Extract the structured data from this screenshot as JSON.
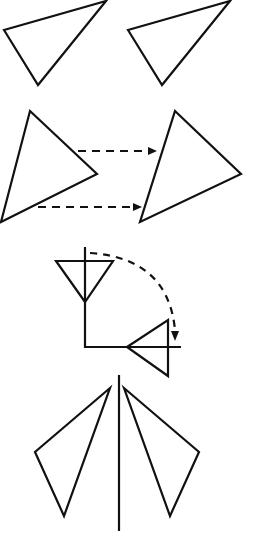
{
  "figure": {
    "width": 257,
    "height": 551,
    "stroke_color": "#111111",
    "background": "#ffffff",
    "panels": [
      {
        "name": "identical-triangles",
        "description": "Two congruent triangles side by side",
        "triangles": [
          {
            "points": "4,30 106,1 38,85"
          },
          {
            "points": "128,30 230,1 162,85"
          }
        ]
      },
      {
        "name": "translation",
        "description": "Triangle translated right with dashed arrows",
        "triangles": [
          {
            "points": "30,111 97,174 1,222"
          },
          {
            "points": "175,111 241,174 140,222"
          }
        ],
        "arrows": [
          {
            "x1": 78,
            "y1": 151,
            "x2": 156,
            "y2": 151
          },
          {
            "x1": 38,
            "y1": 207,
            "x2": 141,
            "y2": 207
          }
        ]
      },
      {
        "name": "rotation",
        "description": "Triangle rotated 90 degrees clockwise about a point",
        "triangles": [
          {
            "points": "56,261 113,261 85,302"
          },
          {
            "points": "127,347 168,320 168,376"
          }
        ],
        "axes": {
          "vertical": {
            "x": 85,
            "y1": 247,
            "y2": 347
          },
          "horizontal": {
            "y": 347,
            "x1": 85,
            "x2": 181
          }
        },
        "arc": "M 90 253 Q 168 262 175 336"
      },
      {
        "name": "reflection",
        "description": "Triangle reflected across a vertical mirror line",
        "triangles": [
          {
            "points": "110,388 35,452 64,516"
          },
          {
            "points": "124,388 199,452 170,516"
          }
        ],
        "mirror": {
          "x": 119,
          "y1": 375,
          "y2": 531
        }
      }
    ]
  }
}
